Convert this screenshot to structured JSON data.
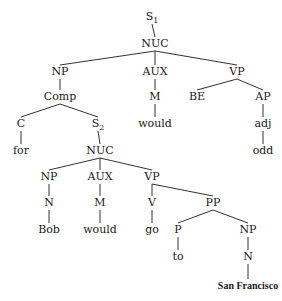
{
  "diagram": {
    "type": "syntax-tree",
    "nodes": {
      "s1": {
        "label": "S",
        "sub": "1",
        "x": 152,
        "y": 20
      },
      "nuc1": {
        "label": "NUC",
        "x": 155,
        "y": 47
      },
      "np1": {
        "label": "NP",
        "x": 60,
        "y": 75
      },
      "aux1": {
        "label": "AUX",
        "x": 155,
        "y": 75
      },
      "vp1": {
        "label": "VP",
        "x": 237,
        "y": 75
      },
      "comp": {
        "label": "Comp",
        "x": 60,
        "y": 100
      },
      "m1": {
        "label": "M",
        "x": 155,
        "y": 100
      },
      "be": {
        "label": "BE",
        "x": 197,
        "y": 100
      },
      "ap": {
        "label": "AP",
        "x": 263,
        "y": 100
      },
      "c": {
        "label": "C",
        "x": 21,
        "y": 127
      },
      "s2": {
        "label": "S",
        "sub": "2",
        "x": 98,
        "y": 127
      },
      "would1": {
        "label": "would",
        "x": 155,
        "y": 127
      },
      "adj": {
        "label": "adj",
        "x": 263,
        "y": 127
      },
      "for": {
        "label": "for",
        "x": 21,
        "y": 154
      },
      "nuc2": {
        "label": "NUC",
        "x": 100,
        "y": 154
      },
      "odd": {
        "label": "odd",
        "x": 263,
        "y": 154
      },
      "np2": {
        "label": "NP",
        "x": 49,
        "y": 180
      },
      "aux2": {
        "label": "AUX",
        "x": 100,
        "y": 180
      },
      "vp2": {
        "label": "VP",
        "x": 152,
        "y": 180
      },
      "n1": {
        "label": "N",
        "x": 49,
        "y": 206
      },
      "m2": {
        "label": "M",
        "x": 100,
        "y": 206
      },
      "v": {
        "label": "V",
        "x": 152,
        "y": 206
      },
      "pp": {
        "label": "PP",
        "x": 213,
        "y": 206
      },
      "bob": {
        "label": "Bob",
        "x": 49,
        "y": 233
      },
      "would2": {
        "label": "would",
        "x": 100,
        "y": 233
      },
      "go": {
        "label": "go",
        "x": 152,
        "y": 233
      },
      "p": {
        "label": "P",
        "x": 178,
        "y": 233
      },
      "np3": {
        "label": "NP",
        "x": 248,
        "y": 233
      },
      "to": {
        "label": "to",
        "x": 178,
        "y": 260
      },
      "n2": {
        "label": "N",
        "x": 248,
        "y": 260
      },
      "sanfrancisco": {
        "label": "San Francisco",
        "x": 248,
        "y": 289
      }
    },
    "edges": [
      [
        "s1",
        "nuc1"
      ],
      [
        "nuc1",
        "np1"
      ],
      [
        "nuc1",
        "aux1"
      ],
      [
        "nuc1",
        "vp1"
      ],
      [
        "np1",
        "comp"
      ],
      [
        "aux1",
        "m1"
      ],
      [
        "vp1",
        "be"
      ],
      [
        "vp1",
        "ap"
      ],
      [
        "comp",
        "c"
      ],
      [
        "comp",
        "s2"
      ],
      [
        "m1",
        "would1"
      ],
      [
        "ap",
        "adj"
      ],
      [
        "c",
        "for"
      ],
      [
        "s2",
        "nuc2"
      ],
      [
        "adj",
        "odd"
      ],
      [
        "nuc2",
        "np2"
      ],
      [
        "nuc2",
        "aux2"
      ],
      [
        "nuc2",
        "vp2"
      ],
      [
        "np2",
        "n1"
      ],
      [
        "aux2",
        "m2"
      ],
      [
        "vp2",
        "v"
      ],
      [
        "vp2",
        "pp"
      ],
      [
        "n1",
        "bob"
      ],
      [
        "m2",
        "would2"
      ],
      [
        "v",
        "go"
      ],
      [
        "pp",
        "p"
      ],
      [
        "pp",
        "np3"
      ],
      [
        "p",
        "to"
      ],
      [
        "np3",
        "n2"
      ],
      [
        "n2",
        "sanfrancisco"
      ]
    ]
  }
}
